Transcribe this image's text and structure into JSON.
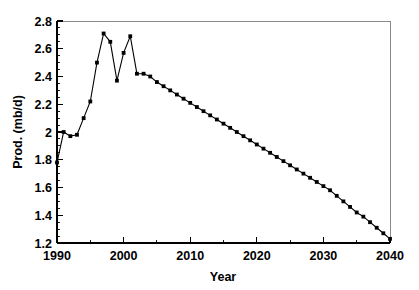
{
  "chart_data": {
    "type": "line",
    "title": "",
    "xlabel": "Year",
    "ylabel": "Prod. (mb/d)",
    "xlim": [
      1990,
      2040
    ],
    "ylim": [
      1.2,
      2.8
    ],
    "grid": false,
    "legend": null,
    "x_ticks_major": [
      1990,
      2000,
      2010,
      2020,
      2030,
      2040
    ],
    "x_tick_labels": [
      "1990",
      "2000",
      "2010",
      "2020",
      "2030",
      "2040"
    ],
    "x_tick_minor_step": 5,
    "y_ticks_major": [
      1.2,
      1.4,
      1.6,
      1.8,
      2.0,
      2.2,
      2.4,
      2.6,
      2.8
    ],
    "y_tick_labels": [
      "1.2",
      "1.4",
      "1.6",
      "1.8",
      "2",
      "2.2",
      "2.4",
      "2.6",
      "2.8"
    ],
    "y_tick_minor_step": 0.05,
    "marker": "square",
    "series": [
      {
        "name": "Production",
        "x": [
          1990,
          1991,
          1992,
          1993,
          1994,
          1995,
          1996,
          1997,
          1998,
          1999,
          2000,
          2001,
          2002,
          2003,
          2004,
          2005,
          2006,
          2007,
          2008,
          2009,
          2010,
          2011,
          2012,
          2013,
          2014,
          2015,
          2016,
          2017,
          2018,
          2019,
          2020,
          2021,
          2022,
          2023,
          2024,
          2025,
          2026,
          2027,
          2028,
          2029,
          2030,
          2031,
          2032,
          2033,
          2034,
          2035,
          2036,
          2037,
          2038,
          2039,
          2040
        ],
        "values": [
          1.78,
          2.0,
          1.97,
          1.98,
          2.1,
          2.22,
          2.5,
          2.71,
          2.65,
          2.37,
          2.57,
          2.69,
          2.42,
          2.42,
          2.4,
          2.36,
          2.33,
          2.3,
          2.27,
          2.24,
          2.21,
          2.18,
          2.15,
          2.12,
          2.09,
          2.06,
          2.03,
          2.0,
          1.97,
          1.94,
          1.91,
          1.88,
          1.85,
          1.82,
          1.79,
          1.76,
          1.73,
          1.7,
          1.67,
          1.64,
          1.61,
          1.58,
          1.54,
          1.5,
          1.46,
          1.42,
          1.39,
          1.35,
          1.31,
          1.27,
          1.23
        ]
      }
    ]
  }
}
